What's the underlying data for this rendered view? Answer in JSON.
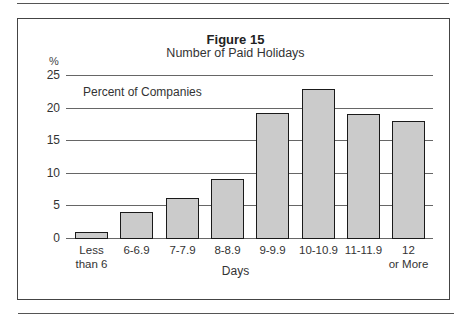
{
  "chart_data": {
    "type": "bar",
    "title": "Figure 15",
    "subtitle": "Number of Paid Holidays",
    "xlabel": "Days",
    "ylabel": "%",
    "series_label": "Percent of Companies",
    "categories": [
      "Less than 6",
      "6-6.9",
      "7-7.9",
      "8-8.9",
      "9-9.9",
      "10-10.9",
      "11-11.9",
      "12 or More"
    ],
    "category_lines": [
      [
        "Less",
        "than 6"
      ],
      [
        "6-6.9"
      ],
      [
        "7-7.9"
      ],
      [
        "8-8.9"
      ],
      [
        "9-9.9"
      ],
      [
        "10-10.9"
      ],
      [
        "11-11.9"
      ],
      [
        "12",
        "or More"
      ]
    ],
    "values": [
      0.9,
      4.0,
      6.1,
      9.0,
      19.2,
      22.9,
      19.0,
      17.9
    ],
    "ylim": [
      0,
      25
    ],
    "yticks": [
      0,
      5,
      10,
      15,
      20,
      25
    ],
    "grid": true,
    "legend_position": "top-left"
  },
  "colors": {
    "bar_fill": "#cbcbcb",
    "bar_edge": "#1a1a1a",
    "grid": "#666666"
  }
}
